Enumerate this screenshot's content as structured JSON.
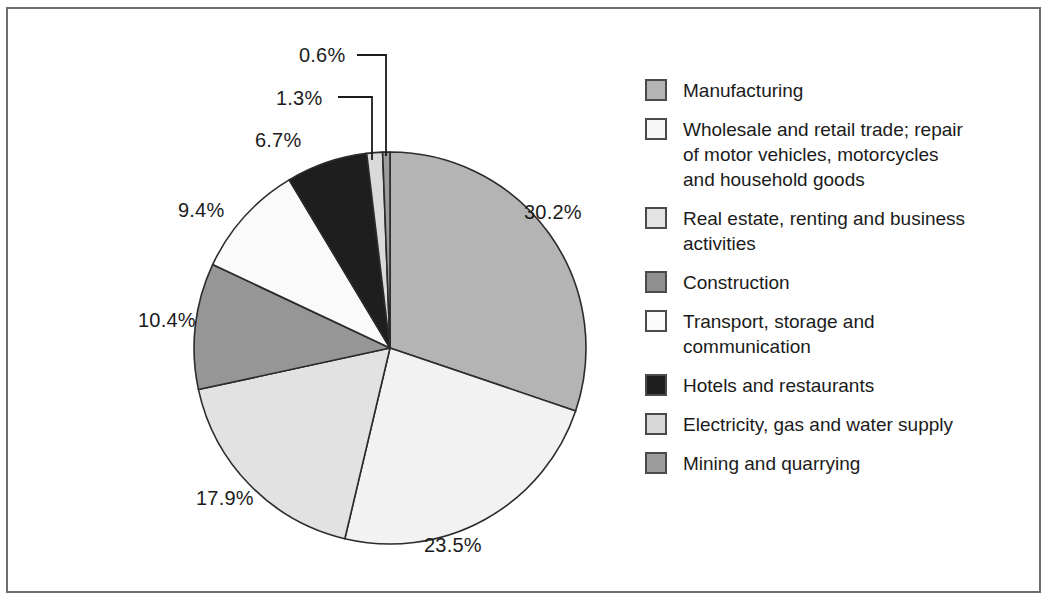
{
  "chart_data": {
    "type": "pie",
    "title": "",
    "legend_position": "right",
    "start_angle_deg": 0,
    "direction": "clockwise",
    "categories": [
      "Manufacturing",
      "Wholesale and retail trade; repair of motor vehicles, motorcycles and household goods",
      "Real estate, renting and business activities",
      "Construction",
      "Transport, storage and communication",
      "Hotels and restaurants",
      "Electricity, gas and water supply",
      "Mining and quarrying"
    ],
    "values": [
      30.2,
      23.5,
      17.9,
      10.4,
      9.4,
      6.7,
      1.3,
      0.6
    ],
    "value_labels": [
      "30.2%",
      "23.5%",
      "17.9%",
      "10.4%",
      "9.4%",
      "6.7%",
      "1.3%",
      "0.6%"
    ],
    "colors": [
      "#b4b4b4",
      "#f2f2f2",
      "#e2e2e2",
      "#969696",
      "#fafafa",
      "#1e1e1e",
      "#dadada",
      "#9c9c9c"
    ],
    "slice_stroke": "#2b2b2b",
    "units": "percent"
  },
  "pie": {
    "center_x": 390,
    "center_y": 348,
    "radius": 196,
    "labels": [
      {
        "text": "30.2%",
        "x": 524,
        "y": 201,
        "leader": false
      },
      {
        "text": "23.5%",
        "x": 424,
        "y": 534,
        "leader": false
      },
      {
        "text": "17.9%",
        "x": 196,
        "y": 487,
        "leader": false
      },
      {
        "text": "10.4%",
        "x": 138,
        "y": 309,
        "leader": false
      },
      {
        "text": "9.4%",
        "x": 178,
        "y": 199,
        "leader": false
      },
      {
        "text": "6.7%",
        "x": 255,
        "y": 129,
        "leader": false
      },
      {
        "text": "1.3%",
        "x": 276,
        "y": 87,
        "leader": true
      },
      {
        "text": "0.6%",
        "x": 299,
        "y": 44,
        "leader": true
      }
    ],
    "leaders": [
      {
        "name": "leader-1-3",
        "x1": 338,
        "y1": 97,
        "x2": 372,
        "y2": 97,
        "x3": 372,
        "y3": 160
      },
      {
        "name": "leader-0-6",
        "x1": 357,
        "y1": 55,
        "x2": 386,
        "y2": 55,
        "x3": 386,
        "y3": 156
      }
    ]
  },
  "legend": {
    "items": [
      {
        "label": "Manufacturing",
        "color": "#b4b4b4"
      },
      {
        "label": "Wholesale and retail trade; repair of motor vehicles, motorcycles and household goods",
        "color": "#f7f7f7"
      },
      {
        "label": "Real estate, renting and business activities",
        "color": "#e4e4e4"
      },
      {
        "label": "Construction",
        "color": "#8f8f8f"
      },
      {
        "label": "Transport, storage and communication",
        "color": "#fbfbfb"
      },
      {
        "label": "Hotels and restaurants",
        "color": "#1e1e1e"
      },
      {
        "label": "Electricity, gas and water supply",
        "color": "#d8d8d8"
      },
      {
        "label": "Mining and quarrying",
        "color": "#9c9c9c"
      }
    ]
  },
  "frame": {
    "border_color": "#6d6d6d",
    "background": "#ffffff"
  }
}
